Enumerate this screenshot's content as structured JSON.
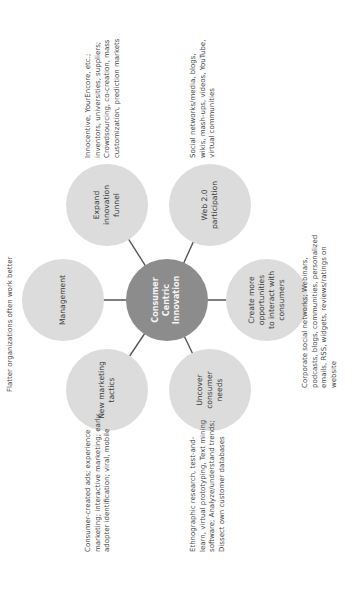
{
  "diagram": {
    "center": {
      "label": "Consumer\nCentric\nInnovation",
      "color": "#8c8c8c"
    },
    "nodes": [
      {
        "id": "management",
        "label": "Management"
      },
      {
        "id": "expand-innovation-funnel",
        "label": "Expand innovation\nfunnel"
      },
      {
        "id": "web-2-0-participation",
        "label": "Web 2.0\nparticipation"
      },
      {
        "id": "create-more-opportunities",
        "label": "Create more\nopportunities\nto interact with\nconsumers"
      },
      {
        "id": "uncover-consumer-needs",
        "label": "Uncover\nconsumer\nneeds"
      },
      {
        "id": "new-marketing-tactics",
        "label": "New marketing\ntactics"
      }
    ],
    "node_color": "#dcdcdc",
    "link_color": "#555555",
    "notes": {
      "management": "Flatter organizations often work better",
      "expand": "Innocentive, YourEncore, etc.;\ninventors, universities, suppliers;\nCrowdsourcing, co-creation, mass\ncustomization, prediction markets",
      "web20": "Social networks/media, blogs,\nwikis, mash-ups, videos, YouTube,\nvirtual communities",
      "create": "Corporate social networks; Webinars,\npodcasts, blogs, communities, personalized\nemails, RSS, widgets, reviews/ratings on\nwebsite",
      "uncover": "Ethnographic research, test-and-\nlearn, virtual prototyping, Text mining\nsoftware; Analyze/understand trends;\nDissect own customer databases",
      "marketing": "Consumer-created ads; experience\nmarketing; interactive marketing; early\nadopter identification; viral, mobile"
    }
  }
}
